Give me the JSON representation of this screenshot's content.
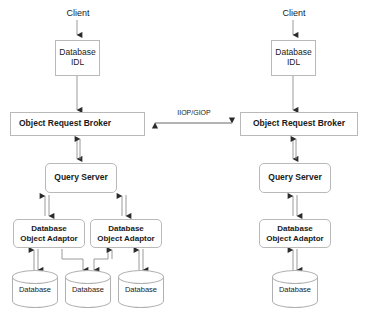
{
  "diagram": {
    "protocol_link": {
      "label": "IIOP/GIOP",
      "direction": "bidirectional"
    },
    "colors": {
      "box_border": "#b9b9b9",
      "cylinder_border": "#b0b0b0",
      "connector": "#9a9a9a",
      "arrow_head": "#2b2b2b",
      "text": "#1a1a1a",
      "background": "#ffffff"
    },
    "left_side": {
      "client_label": "Client",
      "idl_box": {
        "line1": "Database",
        "line2": "IDL"
      },
      "orb_box": {
        "label": "Object Request Broker"
      },
      "query_server": {
        "label": "Query Server"
      },
      "adaptors": [
        {
          "line1": "Database",
          "line2": "Object Adaptor"
        },
        {
          "line1": "Database",
          "line2": "Object Adaptor"
        }
      ],
      "databases": [
        {
          "label": "Database"
        },
        {
          "label": "Database"
        },
        {
          "label": "Database"
        }
      ]
    },
    "right_side": {
      "client_label": "Client",
      "idl_box": {
        "line1": "Database",
        "line2": "IDL"
      },
      "orb_box": {
        "label": "Object Request Broker"
      },
      "query_server": {
        "label": "Query Server"
      },
      "adaptors": [
        {
          "line1": "Database",
          "line2": "Object Adaptor"
        }
      ],
      "databases": [
        {
          "label": "Database"
        }
      ]
    }
  }
}
